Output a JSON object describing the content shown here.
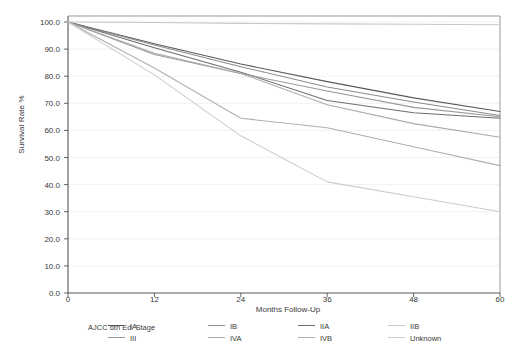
{
  "chart_data": {
    "type": "line",
    "title": "",
    "xlabel": "Months Follow-Up",
    "ylabel": "Survival Rate %",
    "x": [
      0,
      12,
      24,
      36,
      48,
      60
    ],
    "xticks": [
      "0",
      "12",
      "24",
      "36",
      "48",
      "60"
    ],
    "yticks": [
      "0.0",
      "10.0",
      "20.0",
      "30.0",
      "40.0",
      "50.0",
      "60.0",
      "70.0",
      "80.0",
      "90.0",
      "100.0"
    ],
    "xlim": [
      0,
      60
    ],
    "ylim": [
      0,
      100
    ],
    "grid": true,
    "legend_title": "AJCC 6th Ed. Stage",
    "legend_position": "below-plot",
    "series": [
      {
        "name": "IA",
        "color": "#5a5a5a",
        "values": [
          100.0,
          92.0,
          84.5,
          78.0,
          72.0,
          67.0
        ]
      },
      {
        "name": "IB",
        "color": "#8c8c8c",
        "values": [
          100.0,
          91.5,
          83.5,
          76.0,
          70.5,
          65.5
        ]
      },
      {
        "name": "IIA",
        "color": "#6e6e6e",
        "values": [
          100.0,
          90.5,
          81.5,
          71.0,
          66.5,
          64.5
        ]
      },
      {
        "name": "IIB",
        "color": "#c8c8c8",
        "values": [
          100.0,
          99.8,
          99.5,
          99.3,
          99.2,
          99.0
        ]
      },
      {
        "name": "III",
        "color": "#999999",
        "values": [
          100.0,
          88.0,
          81.0,
          74.5,
          68.5,
          65.0
        ]
      },
      {
        "name": "IVA",
        "color": "#aaaaaa",
        "values": [
          100.0,
          88.5,
          81.0,
          69.5,
          62.5,
          57.5
        ]
      },
      {
        "name": "IVB",
        "color": "#b0b0b0",
        "values": [
          100.0,
          83.0,
          64.5,
          61.0,
          54.0,
          47.0
        ]
      },
      {
        "name": "Unknown",
        "color": "#cccccc",
        "values": [
          100.0,
          80.5,
          58.0,
          41.0,
          35.5,
          30.0
        ]
      }
    ]
  },
  "legend": {
    "title": "AJCC 6th Ed. Stage",
    "items": [
      {
        "label": "IA"
      },
      {
        "label": "IB"
      },
      {
        "label": "IIA"
      },
      {
        "label": "IIB"
      },
      {
        "label": "III"
      },
      {
        "label": "IVA"
      },
      {
        "label": "IVB"
      },
      {
        "label": "Unknown"
      }
    ]
  }
}
